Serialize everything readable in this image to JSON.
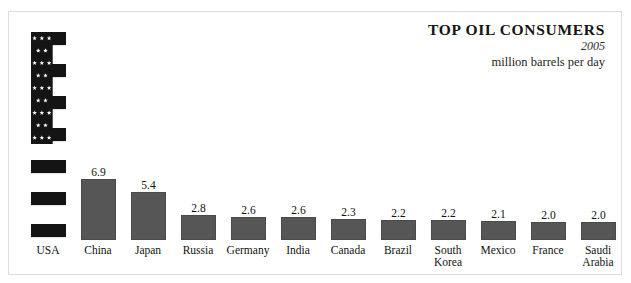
{
  "title": {
    "heading": "TOP OIL CONSUMERS",
    "year": "2005",
    "units": "million barrels per day"
  },
  "chart_data": {
    "type": "bar",
    "title": "TOP OIL CONSUMERS",
    "subtitle": "2005",
    "xlabel": "",
    "ylabel": "million barrels per day",
    "ylim": [
      0,
      20.7
    ],
    "grid": false,
    "legend": false,
    "categories": [
      "USA",
      "China",
      "Japan",
      "Russia",
      "Germany",
      "India",
      "Canada",
      "Brazil",
      "South Korea",
      "Mexico",
      "France",
      "Saudi Arabia"
    ],
    "values": [
      20.7,
      6.9,
      5.4,
      2.8,
      2.6,
      2.6,
      2.3,
      2.2,
      2.2,
      2.1,
      2.0,
      2.0
    ],
    "value_labels": [
      "20.7",
      "6.9",
      "5.4",
      "2.8",
      "2.6",
      "2.6",
      "2.3",
      "2.2",
      "2.2",
      "2.1",
      "2.0",
      "2.0"
    ],
    "bars": [
      {
        "category": "USA",
        "label_line1": "USA",
        "label_line2": "",
        "value": 20.7,
        "value_label": "20.7",
        "fill": "us-flag",
        "px_height": 208
      },
      {
        "category": "China",
        "label_line1": "China",
        "label_line2": "",
        "value": 6.9,
        "value_label": "6.9",
        "fill": "#565656",
        "px_height": 61
      },
      {
        "category": "Japan",
        "label_line1": "Japan",
        "label_line2": "",
        "value": 5.4,
        "value_label": "5.4",
        "fill": "#565656",
        "px_height": 48
      },
      {
        "category": "Russia",
        "label_line1": "Russia",
        "label_line2": "",
        "value": 2.8,
        "value_label": "2.8",
        "fill": "#565656",
        "px_height": 25
      },
      {
        "category": "Germany",
        "label_line1": "Germany",
        "label_line2": "",
        "value": 2.6,
        "value_label": "2.6",
        "fill": "#565656",
        "px_height": 23
      },
      {
        "category": "India",
        "label_line1": "India",
        "label_line2": "",
        "value": 2.6,
        "value_label": "2.6",
        "fill": "#565656",
        "px_height": 23
      },
      {
        "category": "Canada",
        "label_line1": "Canada",
        "label_line2": "",
        "value": 2.3,
        "value_label": "2.3",
        "fill": "#565656",
        "px_height": 21
      },
      {
        "category": "Brazil",
        "label_line1": "Brazil",
        "label_line2": "",
        "value": 2.2,
        "value_label": "2.2",
        "fill": "#565656",
        "px_height": 20
      },
      {
        "category": "South Korea",
        "label_line1": "South",
        "label_line2": "Korea",
        "value": 2.2,
        "value_label": "2.2",
        "fill": "#565656",
        "px_height": 20
      },
      {
        "category": "Mexico",
        "label_line1": "Mexico",
        "label_line2": "",
        "value": 2.1,
        "value_label": "2.1",
        "fill": "#565656",
        "px_height": 19
      },
      {
        "category": "France",
        "label_line1": "France",
        "label_line2": "",
        "value": 2.0,
        "value_label": "2.0",
        "fill": "#565656",
        "px_height": 18
      },
      {
        "category": "Saudi Arabia",
        "label_line1": "Saudi",
        "label_line2": "Arabia",
        "value": 2.0,
        "value_label": "2.0",
        "fill": "#565656",
        "px_height": 18
      }
    ]
  },
  "colors": {
    "bar_fill": "#565656",
    "bar_stroke": "#4a4a4a",
    "card_border": "#dcdcdc",
    "text": "#111111",
    "flag_dark": "#141414",
    "flag_light": "#ffffff"
  }
}
